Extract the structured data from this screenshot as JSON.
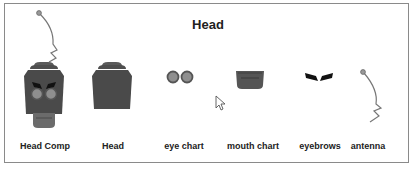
{
  "diagram": {
    "title": "Head",
    "parts": [
      {
        "id": "head-comp",
        "label": "Head Comp"
      },
      {
        "id": "head",
        "label": "Head"
      },
      {
        "id": "eye-chart",
        "label": "eye chart"
      },
      {
        "id": "mouth-chart",
        "label": "mouth chart"
      },
      {
        "id": "eyebrows",
        "label": "eyebrows"
      },
      {
        "id": "antenna",
        "label": "antenna"
      }
    ]
  },
  "colors": {
    "head_body": "#4a4a4a",
    "head_top": "#5a5a5a",
    "eye_ring": "#555555",
    "eye_fill": "#8f8f8f",
    "mouth": "#6b6b6b",
    "eyebrow": "#111111",
    "antenna_line": "#777777",
    "frame_border": "#8a8a8a"
  }
}
